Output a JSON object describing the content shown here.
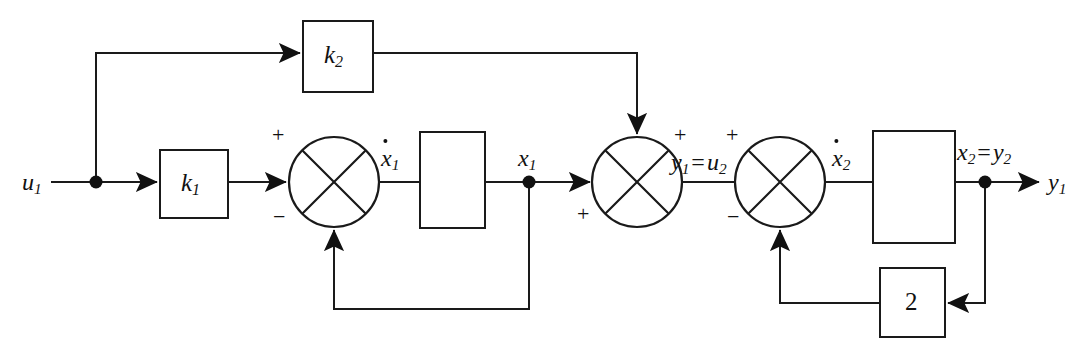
{
  "diagram": {
    "type": "control-block-diagram",
    "canvas": {
      "width": 1090,
      "height": 356,
      "background": "#ffffff",
      "line_color": "#1a1a1a"
    },
    "signals": {
      "input": "u",
      "input_sub": "1",
      "state1_dot": "x",
      "state1_dot_sub": "1",
      "state1": "x",
      "state1_sub": "1",
      "interstage_lhs": "y",
      "interstage_lhs_sub": "1",
      "interstage_eq": "=",
      "interstage_rhs": "u",
      "interstage_rhs_sub": "2",
      "state2_dot": "x",
      "state2_dot_sub": "2",
      "state2_lhs": "x",
      "state2_lhs_sub": "2",
      "state2_eq": "=",
      "state2_rhs": "y",
      "state2_rhs_sub": "2",
      "output": "y",
      "output_sub": "1"
    },
    "blocks": [
      {
        "id": "gain-k1",
        "label": "k",
        "sublabel": "1",
        "kind": "gain",
        "x": 160,
        "y": 150,
        "w": 68,
        "h": 68
      },
      {
        "id": "gain-k2",
        "label": "k",
        "sublabel": "2",
        "kind": "gain",
        "x": 303,
        "y": 21,
        "w": 70,
        "h": 71
      },
      {
        "id": "integrator-1",
        "label": "",
        "sublabel": "",
        "kind": "integrator",
        "x": 420,
        "y": 132,
        "w": 65,
        "h": 96
      },
      {
        "id": "integrator-2",
        "label": "",
        "sublabel": "",
        "kind": "integrator",
        "x": 873,
        "y": 131,
        "w": 82,
        "h": 112
      },
      {
        "id": "gain-2",
        "label": "2",
        "sublabel": "",
        "kind": "gain",
        "x": 880,
        "y": 268,
        "w": 65,
        "h": 69
      }
    ],
    "summers": [
      {
        "id": "summer-1",
        "cx": 334,
        "cy": 182,
        "r": 45,
        "signs": [
          {
            "text": "+",
            "x": 274,
            "y": 128
          },
          {
            "text": "−",
            "x": 275,
            "y": 212
          }
        ]
      },
      {
        "id": "summer-2",
        "cx": 637,
        "cy": 182,
        "r": 45,
        "signs": [
          {
            "text": "+",
            "x": 676,
            "y": 128
          },
          {
            "text": "+",
            "x": 577,
            "y": 207
          }
        ]
      },
      {
        "id": "summer-3",
        "cx": 780,
        "cy": 182,
        "r": 45,
        "signs": [
          {
            "text": "+",
            "x": 728,
            "y": 128
          },
          {
            "text": "−",
            "x": 728,
            "y": 212
          }
        ]
      }
    ],
    "junction_dots": [
      {
        "id": "tap-u1",
        "cx": 96,
        "cy": 182,
        "r": 6
      },
      {
        "id": "tap-x1",
        "cx": 529,
        "cy": 182,
        "r": 6
      },
      {
        "id": "tap-x2",
        "cx": 985,
        "cy": 182,
        "r": 6
      }
    ],
    "labels": {
      "gain_k1": "k₁",
      "gain_k2": "k₂",
      "gain_2": "2"
    }
  }
}
